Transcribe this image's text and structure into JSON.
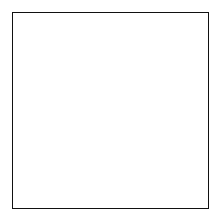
{
  "figure": {
    "title": "",
    "caption": "",
    "background_color": "#ffffff",
    "frame_color": "#111111",
    "frame": {
      "x": 12,
      "y": 12,
      "width": 197,
      "height": 197
    }
  },
  "chart_data": {
    "type": "line",
    "title": "",
    "subtitle": "",
    "xlabel": "",
    "ylabel": "",
    "xlim": [
      12,
      209
    ],
    "ylim": [
      12,
      209
    ],
    "grid": true,
    "legend_position": "none",
    "tick_labels_x": [],
    "tick_labels_y": [],
    "annotations": [],
    "colors": {
      "boundary": "#000000",
      "contour": "#5a5a5a",
      "mesh": "#6a6a6a",
      "grid": "#b9b9b9",
      "frame": "#111111",
      "background": "#ffffff"
    },
    "series": [
      {
        "name": "domain-boundary",
        "kind": "closed-curve",
        "stroke": "#000000",
        "stroke_width": 1.9,
        "center": [
          113,
          113
        ],
        "bounds": {
          "left": 57,
          "right": 171,
          "top": 69,
          "bottom": 158
        },
        "shape": "bean",
        "notch": {
          "x": 113,
          "y": 148,
          "depth": 10
        },
        "radii_by_angle_deg": {
          "0": 58,
          "30": 54,
          "60": 45,
          "90": 44,
          "120": 47,
          "150": 55,
          "180": 56,
          "210": 44,
          "240": 34,
          "270": 35,
          "300": 42,
          "330": 53
        }
      },
      {
        "name": "interior-contours",
        "kind": "nested-closed-curves",
        "stroke": "#5a5a5a",
        "stroke_width": 0.85,
        "count": 11,
        "scales": [
          0.94,
          0.86,
          0.78,
          0.7,
          0.62,
          0.54,
          0.455,
          0.37,
          0.285,
          0.2,
          0.12
        ],
        "center": [
          113,
          113
        ]
      },
      {
        "name": "exterior-mesh-radial",
        "kind": "curvilinear-rays",
        "stroke": "#6a6a6a",
        "stroke_width": 0.9,
        "count": 28
      },
      {
        "name": "exterior-mesh-rings",
        "kind": "curvilinear-rings",
        "stroke": "#6a6a6a",
        "stroke_width": 0.9,
        "count": 9,
        "scales": [
          1.14,
          1.32,
          1.54,
          1.8,
          2.1,
          2.45,
          2.85,
          3.3,
          3.85
        ]
      },
      {
        "name": "background-cartesian-grid",
        "kind": "rectilinear-grid",
        "stroke": "#b9b9b9",
        "stroke_width": 0.75,
        "columns": 16,
        "rows": 16,
        "spacing_px": 12.3
      }
    ]
  }
}
